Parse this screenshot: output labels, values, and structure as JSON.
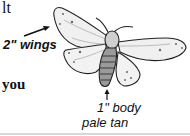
{
  "text_fragments": {
    "top_left": "lt",
    "left_middle": "you"
  },
  "labels": {
    "wings": "2\" wings",
    "body_size": "1\" body",
    "body_color": "pale tan"
  },
  "illustration": {
    "subject": "moth",
    "style": "black-and-white line drawing"
  }
}
